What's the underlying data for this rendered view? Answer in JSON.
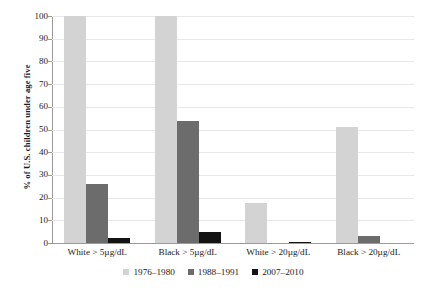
{
  "chart_data": {
    "type": "bar",
    "title": "",
    "xlabel": "",
    "ylabel": "% of U.S. children under age five",
    "ylim": [
      0,
      100
    ],
    "yticks": [
      0,
      10,
      20,
      30,
      40,
      50,
      60,
      70,
      80,
      90,
      100
    ],
    "grid": true,
    "legend_position": "bottom",
    "categories": [
      "White > 5µg/dL",
      "Black > 5µg/dL",
      "White > 20µg/dL",
      "Black > 20µg/dL"
    ],
    "series": [
      {
        "name": "1976–1980",
        "color": "#d3d3d3",
        "values": [
          100,
          100,
          17.6,
          51
        ]
      },
      {
        "name": "1988–1991",
        "color": "#6c6c6c",
        "values": [
          26,
          53.7,
          0,
          3
        ]
      },
      {
        "name": "2007–2010",
        "color": "#131313",
        "values": [
          2.3,
          5,
          0.5,
          0
        ]
      }
    ]
  },
  "axis": {
    "y_title": "% of U.S. children under age five"
  }
}
